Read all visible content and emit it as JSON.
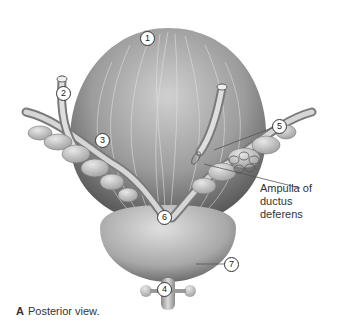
{
  "figure": {
    "labels": [
      {
        "id": "1",
        "text": "1"
      },
      {
        "id": "2",
        "text": "2"
      },
      {
        "id": "3",
        "text": "3"
      },
      {
        "id": "4",
        "text": "4"
      },
      {
        "id": "5",
        "text": "5"
      },
      {
        "id": "6",
        "text": "6"
      },
      {
        "id": "7",
        "text": "7"
      }
    ],
    "annotation": {
      "line1": "Ampulla of",
      "line2": "ductus deferens"
    },
    "caption": {
      "letter": "A",
      "text": "Posterior view."
    },
    "colors": {
      "bladder": "#9a9a9a",
      "prostate": "#b5b5b5",
      "leader_line": "#555555"
    }
  }
}
